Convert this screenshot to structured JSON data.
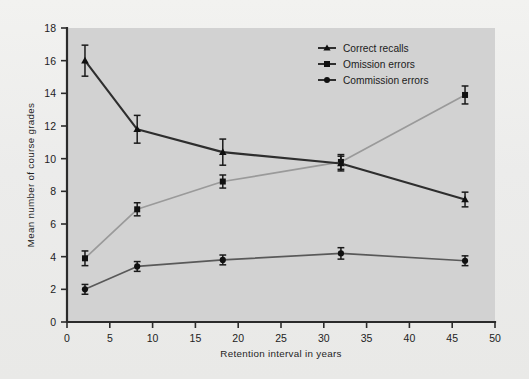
{
  "figure": {
    "background_color": "#eeeeec",
    "plot_background_color": "#d2d2d2",
    "axis_color": "#2b2b2b"
  },
  "chart_data": {
    "type": "line",
    "title": "",
    "xlabel": "Retention interval in years",
    "ylabel": "Mean number of course grades",
    "xlim": [
      0,
      50
    ],
    "ylim": [
      0,
      18
    ],
    "xticks": [
      0,
      5,
      10,
      15,
      20,
      25,
      30,
      35,
      40,
      45,
      50
    ],
    "xticklabels": [
      "0",
      "5",
      "10",
      "15",
      "20",
      "25",
      "30",
      "35",
      "40",
      "45",
      "50"
    ],
    "yticks": [
      0,
      2,
      4,
      6,
      8,
      10,
      12,
      14,
      16,
      18
    ],
    "yticklabels": [
      "0",
      "2",
      "4",
      "6",
      "8",
      "10",
      "12",
      "14",
      "16",
      "18"
    ],
    "grid": false,
    "legend_position": "top-center-right",
    "x": [
      2.1,
      8.2,
      18.2,
      32.0,
      46.5
    ],
    "series": [
      {
        "name": "Correct recalls",
        "color": "#2e2e2e",
        "marker": "triangle",
        "values": [
          16.0,
          11.8,
          10.4,
          9.7,
          7.5
        ],
        "errors": [
          0.95,
          0.85,
          0.8,
          0.45,
          0.45
        ]
      },
      {
        "name": "Omission errors",
        "color": "#9a9a9a",
        "marker": "square",
        "values": [
          3.9,
          6.9,
          8.6,
          9.8,
          13.9
        ],
        "errors": [
          0.45,
          0.4,
          0.4,
          0.45,
          0.55
        ]
      },
      {
        "name": "Commission errors",
        "color": "#595959",
        "marker": "circle",
        "values": [
          2.0,
          3.4,
          3.8,
          4.2,
          3.75
        ],
        "errors": [
          0.3,
          0.3,
          0.3,
          0.35,
          0.3
        ]
      }
    ]
  },
  "legend": {
    "items": [
      {
        "label": "Correct recalls"
      },
      {
        "label": "Omission errors"
      },
      {
        "label": "Commission errors"
      }
    ]
  }
}
